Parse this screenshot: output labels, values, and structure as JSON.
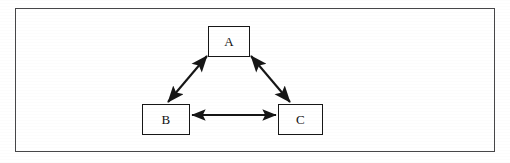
{
  "figure": {
    "type": "node-link-diagram",
    "shape": "triangle",
    "background_color": "#ffffff",
    "frame": {
      "visible": true,
      "color": "#2b2b2b",
      "style": "solid-rectangle-border"
    },
    "stroke_color": "#161616",
    "label_color": "#111111"
  },
  "nodes": [
    {
      "id": "A",
      "label": "A",
      "position": "top-center",
      "shape": "rectangle"
    },
    {
      "id": "B",
      "label": "B",
      "position": "bottom-left",
      "shape": "rectangle"
    },
    {
      "id": "C",
      "label": "C",
      "position": "bottom-right",
      "shape": "rectangle"
    }
  ],
  "edges": [
    {
      "id": "a-b",
      "from": "A",
      "to": "B",
      "direction": "bidirectional",
      "arrowheads": "both",
      "orientation": "diagonal-down-left"
    },
    {
      "id": "a-c",
      "from": "A",
      "to": "C",
      "direction": "bidirectional",
      "arrowheads": "both",
      "orientation": "diagonal-down-right"
    },
    {
      "id": "b-c",
      "from": "B",
      "to": "C",
      "direction": "bidirectional",
      "arrowheads": "both",
      "orientation": "horizontal"
    }
  ]
}
